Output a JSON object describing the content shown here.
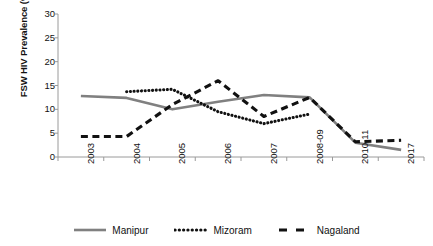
{
  "chart_data": {
    "type": "line",
    "title": "",
    "xlabel": "",
    "ylabel": "FSW HIV Prevalence (%)",
    "categories": [
      "2003",
      "2004",
      "2005",
      "2006",
      "2007",
      "2008-09",
      "2010-11",
      "2017"
    ],
    "ylim": [
      0,
      30
    ],
    "ytick_labels": [
      "0",
      "5",
      "10",
      "15",
      "20",
      "25",
      "30"
    ],
    "ytick_values": [
      0,
      5,
      10,
      15,
      20,
      25,
      30
    ],
    "grid": false,
    "legend_position": "bottom",
    "series": [
      {
        "name": "Manipur",
        "style": "solid",
        "color": "#808080",
        "values": [
          12.8,
          12.4,
          10.0,
          11.6,
          13.0,
          12.5,
          3.0,
          1.5
        ]
      },
      {
        "name": "Mizoram",
        "style": "dotted",
        "color": "#111111",
        "values": [
          null,
          13.7,
          14.2,
          9.5,
          7.0,
          9.0,
          null,
          null
        ]
      },
      {
        "name": "Nagaland",
        "style": "dashed",
        "color": "#111111",
        "values": [
          4.3,
          4.3,
          11.0,
          16.0,
          8.5,
          12.5,
          3.2,
          3.5
        ]
      }
    ]
  },
  "legend": {
    "items": [
      {
        "label": "Manipur",
        "icon": "solid-line-swatch"
      },
      {
        "label": "Mizoram",
        "icon": "dotted-line-swatch"
      },
      {
        "label": "Nagaland",
        "icon": "dashed-line-swatch"
      }
    ]
  },
  "colors": {
    "manipur": "#808080",
    "mizoram": "#111111",
    "nagaland": "#111111",
    "axis": "#9a9a9a",
    "text": "#111111",
    "background": "#ffffff"
  }
}
